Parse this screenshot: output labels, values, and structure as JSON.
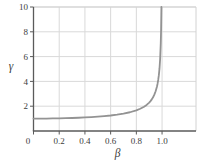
{
  "chart_data": {
    "type": "line",
    "title": "",
    "xlabel": "β",
    "ylabel": "γ",
    "xlim": [
      0,
      1.264
    ],
    "ylim": [
      0,
      10
    ],
    "x_ticks": [
      0,
      0.2,
      0.4,
      0.6,
      0.8,
      1.0
    ],
    "x_tick_labels": [
      "0",
      "0.2",
      "0.4",
      "0.6",
      "0.8",
      "1.0"
    ],
    "y_ticks": [
      2,
      4,
      6,
      8,
      10
    ],
    "y_tick_labels": [
      "2",
      "4",
      "6",
      "8",
      "10"
    ],
    "grid": true,
    "legend": "none",
    "series": [
      {
        "name": "lorentz-factor",
        "formula": "gamma = 1 / sqrt(1 - beta^2)",
        "x": [
          0,
          0.05,
          0.1,
          0.15,
          0.2,
          0.25,
          0.3,
          0.35,
          0.4,
          0.45,
          0.5,
          0.55,
          0.6,
          0.65,
          0.7,
          0.75,
          0.8,
          0.83,
          0.86,
          0.88,
          0.9,
          0.91,
          0.92,
          0.93,
          0.94,
          0.95,
          0.96,
          0.965,
          0.97,
          0.975,
          0.98,
          0.985,
          0.99,
          0.9925,
          0.99499
        ],
        "y": [
          1,
          1.00125,
          1.00504,
          1.01144,
          1.02062,
          1.0328,
          1.04828,
          1.06752,
          1.09109,
          1.1198,
          1.1547,
          1.19737,
          1.25,
          1.3159,
          1.40028,
          1.51186,
          1.66667,
          1.7924,
          1.95972,
          2.10538,
          2.29416,
          2.41192,
          2.55155,
          2.72065,
          2.93105,
          3.20256,
          3.57143,
          3.8131,
          4.11345,
          4.50035,
          5.02519,
          5.79555,
          7.08881,
          8.17766,
          10.0
        ]
      }
    ],
    "colors": {
      "background": "#ffffff",
      "curve": "#939393",
      "grid": "#d9d9d9",
      "frame": "#d2d2d2",
      "axis": "#5a5a5a",
      "text": "#3d3d3d"
    }
  }
}
